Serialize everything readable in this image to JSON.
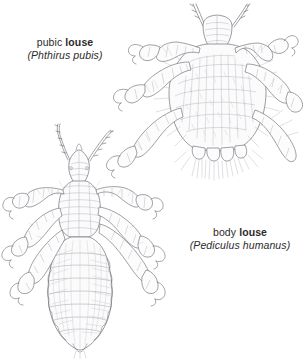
{
  "figure": {
    "background_color": "#ffffff",
    "ink_color": "#6a6a72",
    "specimens": [
      {
        "id": "pubic-louse",
        "common_name_prefix": "pubic",
        "common_name_bold": "louse",
        "scientific_name": "(Phthirus pubis)",
        "position": "top-right",
        "label_position": "left-of-specimen",
        "description": "crab-like louse with broad hairy body and large grasping claws"
      },
      {
        "id": "body-louse",
        "common_name_prefix": "body",
        "common_name_bold": "louse",
        "scientific_name": "(Pediculus humanus)",
        "position": "lower-left",
        "label_position": "right-of-specimen",
        "description": "elongated louse with narrow head, antennae, segmented abdomen and six legs"
      }
    ]
  },
  "labels": {
    "pubic": {
      "prefix": "pubic ",
      "bold": "louse",
      "scientific": "(Phthirus pubis)"
    },
    "body": {
      "prefix": "body ",
      "bold": "louse",
      "scientific": "(Pediculus humanus)"
    }
  }
}
